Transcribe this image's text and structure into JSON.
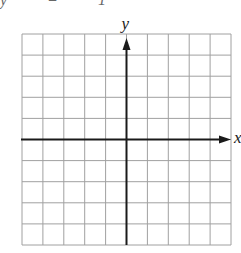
{
  "top_fragment": {
    "text": "y  = 1"
  },
  "graph": {
    "x_label": "x",
    "y_label": "y",
    "grid": {
      "columns": 10,
      "rows": 10,
      "left": 22,
      "top": 34,
      "width": 209,
      "height": 211
    },
    "grid_color": "#a0a0a0",
    "axis_color": "#1a1a1a",
    "origin": {
      "col": 5,
      "row": 5
    }
  },
  "chart_data": {
    "type": "scatter",
    "title": "",
    "xlabel": "x",
    "ylabel": "y",
    "x": [],
    "y": [],
    "xlim": [
      -5,
      5
    ],
    "ylim": [
      -5,
      5
    ],
    "grid": true,
    "tick_labels": false
  }
}
